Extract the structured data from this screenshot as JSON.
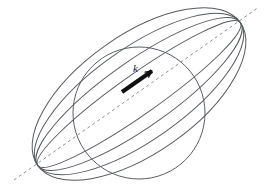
{
  "figure": {
    "name": "wave-vector-sphere-diagram",
    "caption": "",
    "background_color": "#ffffff",
    "width": 270,
    "height": 191
  },
  "colors": {
    "curve_stroke": "#54585e",
    "sphere_stroke": "#5a5e64",
    "axis_dash": "#8d9096",
    "vector_fill": "#111111",
    "label_fill": "#1a1a1a",
    "background": "#ffffff"
  },
  "labels": {
    "wave_vector": "k"
  },
  "axis": {
    "name": "tilted-dashed-axis",
    "style": "dashed",
    "dash_pattern": "3,3",
    "stroke_width": 1,
    "x1": 14,
    "y1": 180,
    "x2": 259,
    "y2": 7
  },
  "sphere": {
    "name": "central-sphere",
    "cx": 139,
    "cy": 113,
    "r": 66,
    "stroke_width": 1
  },
  "vector_arrow": {
    "name": "k-vector-arrow",
    "x1": 122,
    "y1": 92,
    "x2": 152,
    "y2": 71,
    "stroke_width": 4,
    "head_length": 7,
    "head_angle_deg": 26,
    "label_x": 133,
    "label_y": 72
  },
  "ellipses": [
    {
      "id": "ellipse-1",
      "rx": 124,
      "ry": 20,
      "rotation": -35.2,
      "cx": 139,
      "cy": 94
    },
    {
      "id": "ellipse-2",
      "rx": 124,
      "ry": 33,
      "rotation": -35.2,
      "cx": 139,
      "cy": 94
    },
    {
      "id": "ellipse-3",
      "rx": 124,
      "ry": 46,
      "rotation": -35.2,
      "cx": 139,
      "cy": 94
    },
    {
      "id": "ellipse-4",
      "rx": 124,
      "ry": 59,
      "rotation": -35.2,
      "cx": 139,
      "cy": 94
    }
  ],
  "chart_data": {
    "type": "scatter",
    "title": "",
    "xlabel": "",
    "ylabel": "",
    "annotations": [
      "k"
    ],
    "grid": false,
    "legend": "none"
  }
}
